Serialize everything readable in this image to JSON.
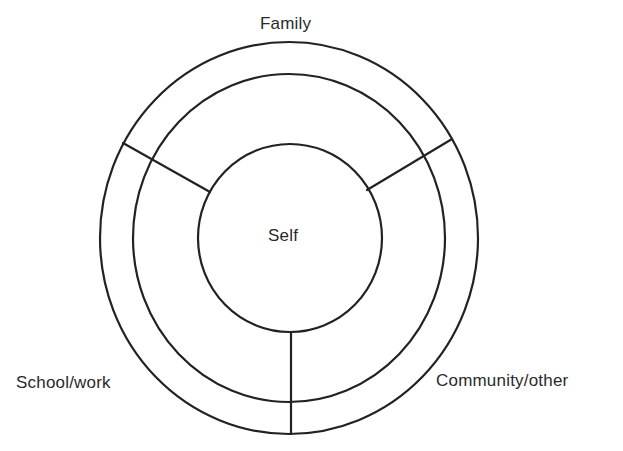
{
  "diagram": {
    "type": "concentric-circles",
    "center_label": "Self",
    "ring_labels": {
      "top": "Family",
      "bottom_left": "School/work",
      "bottom_right": "Community/other"
    },
    "stroke_color": "#222222",
    "background_color": "#ffffff",
    "shapes": {
      "outer_circle": {
        "cx": 289,
        "cy": 238,
        "rx": 189,
        "ry": 196
      },
      "middle_circle": {
        "cx": 289,
        "cy": 238,
        "rx": 156,
        "ry": 164
      },
      "self_circle": {
        "cx": 290,
        "cy": 238,
        "rx": 92,
        "ry": 94
      }
    },
    "sections": [
      "Family",
      "School/work",
      "Community/other"
    ]
  }
}
